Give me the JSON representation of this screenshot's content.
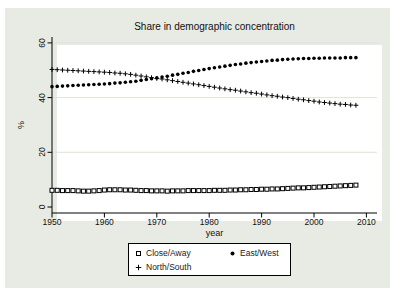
{
  "chart_data": {
    "type": "scatter",
    "title": "Share in demographic concentration",
    "xlabel": "year",
    "ylabel": "%",
    "xticks": [
      1950,
      1960,
      1970,
      1980,
      1990,
      2000,
      2010
    ],
    "yticks": [
      0,
      20,
      40,
      60
    ],
    "xlim": [
      1950,
      2012
    ],
    "ylim": [
      0,
      62
    ],
    "grid": "horizontal-light",
    "legend_position": "below-plot",
    "colors": {
      "background": "#e8ebe3",
      "plot_background": "#ffffff",
      "grid": "#dde3da",
      "axis": "#000000",
      "marker": "#000000",
      "text": "#111111"
    },
    "x": [
      1950,
      1951,
      1952,
      1953,
      1954,
      1955,
      1956,
      1957,
      1958,
      1959,
      1960,
      1961,
      1962,
      1963,
      1964,
      1965,
      1966,
      1967,
      1968,
      1969,
      1970,
      1971,
      1972,
      1973,
      1974,
      1975,
      1976,
      1977,
      1978,
      1979,
      1980,
      1981,
      1982,
      1983,
      1984,
      1985,
      1986,
      1987,
      1988,
      1989,
      1990,
      1991,
      1992,
      1993,
      1994,
      1995,
      1996,
      1997,
      1998,
      1999,
      2000,
      2001,
      2002,
      2003,
      2004,
      2005,
      2006,
      2007,
      2008
    ],
    "series": [
      {
        "name": "Close/Away",
        "marker": "square",
        "values": [
          6.1,
          6.1,
          6.0,
          6.0,
          6.0,
          5.9,
          5.8,
          5.8,
          5.9,
          6.0,
          6.2,
          6.3,
          6.3,
          6.3,
          6.2,
          6.2,
          6.1,
          6.0,
          6.0,
          5.9,
          5.9,
          5.9,
          5.8,
          5.9,
          5.9,
          5.9,
          6.0,
          6.0,
          6.0,
          6.0,
          6.0,
          6.1,
          6.1,
          6.1,
          6.2,
          6.2,
          6.3,
          6.3,
          6.4,
          6.4,
          6.5,
          6.5,
          6.6,
          6.6,
          6.7,
          6.8,
          6.9,
          7.0,
          7.0,
          7.1,
          7.2,
          7.3,
          7.4,
          7.5,
          7.6,
          7.7,
          7.8,
          7.9,
          8.0
        ]
      },
      {
        "name": "East/West",
        "marker": "circle",
        "values": [
          44.0,
          44.1,
          44.2,
          44.3,
          44.4,
          44.5,
          44.6,
          44.7,
          44.8,
          44.9,
          45.0,
          45.1,
          45.3,
          45.4,
          45.6,
          45.8,
          46.0,
          46.3,
          46.6,
          46.9,
          47.2,
          47.5,
          47.8,
          48.2,
          48.5,
          48.9,
          49.2,
          49.6,
          49.9,
          50.3,
          50.6,
          50.9,
          51.2,
          51.5,
          51.8,
          52.1,
          52.3,
          52.6,
          52.8,
          53.0,
          53.2,
          53.4,
          53.6,
          53.7,
          53.9,
          54.0,
          54.1,
          54.2,
          54.3,
          54.3,
          54.4,
          54.4,
          54.5,
          54.5,
          54.5,
          54.5,
          54.6,
          54.6,
          54.6
        ]
      },
      {
        "name": "North/South",
        "marker": "plus",
        "values": [
          50.3,
          50.2,
          50.1,
          50.0,
          49.9,
          49.8,
          49.7,
          49.6,
          49.5,
          49.4,
          49.3,
          49.2,
          49.0,
          48.9,
          48.7,
          48.5,
          48.2,
          47.9,
          47.6,
          47.3,
          47.0,
          46.8,
          46.5,
          46.2,
          45.9,
          45.6,
          45.3,
          45.0,
          44.7,
          44.4,
          44.1,
          43.8,
          43.5,
          43.2,
          42.9,
          42.7,
          42.4,
          42.1,
          41.8,
          41.6,
          41.3,
          41.0,
          40.7,
          40.5,
          40.2,
          40.0,
          39.7,
          39.4,
          39.2,
          38.9,
          38.7,
          38.4,
          38.2,
          38.0,
          37.8,
          37.6,
          37.5,
          37.3,
          37.2
        ]
      }
    ]
  }
}
